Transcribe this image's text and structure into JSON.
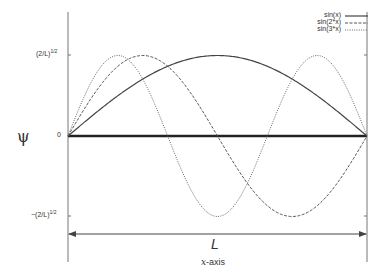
{
  "chart_data": {
    "type": "line",
    "title": "",
    "xlabel": "x-axis",
    "ylabel": "ψ",
    "span_label": "L",
    "x_range": [
      0,
      3.14159
    ],
    "ylim": [
      -1,
      1
    ],
    "y_ticks": [
      {
        "value": 1,
        "label_base": "(2/L)",
        "label_exp": "1/2"
      },
      {
        "value": 0,
        "label_base": "0",
        "label_exp": ""
      },
      {
        "value": -1,
        "label_base": "−(2/L)",
        "label_exp": "1/2"
      }
    ],
    "grid": false,
    "legend_position": "top-right",
    "series": [
      {
        "name": "sin(x)",
        "style": "solid",
        "frequency": 1
      },
      {
        "name": "sin(2*x)",
        "style": "dashed",
        "frequency": 2
      },
      {
        "name": "sin(3*x)",
        "style": "dotted",
        "frequency": 3
      }
    ],
    "baseline": {
      "y": 0,
      "style": "thick-solid"
    }
  },
  "legend": {
    "items": [
      "sin(x)",
      "sin(2*x)",
      "sin(3*x)"
    ]
  },
  "axes": {
    "y_label": "ψ",
    "x_label_italic": "x",
    "x_label_rest": "-axis",
    "span_label": "L",
    "tick_top_base": "(2/L)",
    "tick_top_exp": "1/2",
    "tick_zero": "0",
    "tick_bottom_base": "−(2/L)",
    "tick_bottom_exp": "1/2"
  }
}
